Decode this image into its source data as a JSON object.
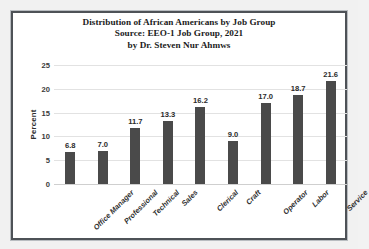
{
  "chart_data": {
    "type": "bar",
    "title": "Distribution of African Americans by Job Group",
    "title_lines": [
      "Distribution of African Americans by Job Group",
      "Source: EEO-1 Job Group, 2021",
      "by Dr. Steven Nur Ahmws"
    ],
    "xlabel": "",
    "ylabel": "Percent",
    "categories": [
      "Office Manager",
      "Professional",
      "Technical",
      "Sales",
      "Clerical",
      "Craft",
      "Operator",
      "Labor",
      "Service"
    ],
    "values": [
      6.8,
      7.0,
      11.7,
      13.3,
      16.2,
      9.0,
      17.0,
      18.7,
      21.6
    ],
    "value_labels": [
      "6.8",
      "7.0",
      "11.7",
      "13.3",
      "16.2",
      "9.0",
      "17.0",
      "18.7",
      "21.6"
    ],
    "ylim": [
      0,
      25
    ],
    "yticks": [
      0,
      5,
      10,
      15,
      20,
      25
    ],
    "ytick_labels": [
      "0",
      "5",
      "10",
      "15",
      "20",
      "25"
    ],
    "grid": true,
    "legend": false,
    "bar_color": "#4a4a4a",
    "grid_color": "#e2e2e2",
    "frame_color": "#4e5257",
    "background_color": "#ffffff"
  }
}
